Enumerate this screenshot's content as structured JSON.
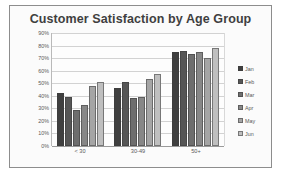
{
  "chart_data": {
    "type": "bar",
    "title": "Customer Satisfaction by Age Group",
    "xlabel": "",
    "ylabel": "",
    "categories": [
      "< 30",
      "30-49",
      "50+"
    ],
    "series": [
      {
        "name": "Jan",
        "color": "#3f3f3f",
        "values": [
          42,
          46,
          75
        ]
      },
      {
        "name": "Feb",
        "color": "#565656",
        "values": [
          39,
          51,
          76
        ]
      },
      {
        "name": "Mar",
        "color": "#6e6e6e",
        "values": [
          29,
          38,
          73
        ]
      },
      {
        "name": "Apr",
        "color": "#878787",
        "values": [
          33,
          39,
          75
        ]
      },
      {
        "name": "May",
        "color": "#a5a5a5",
        "values": [
          48,
          53,
          70
        ]
      },
      {
        "name": "Jun",
        "color": "#bfbfbf",
        "values": [
          51,
          57,
          78
        ]
      }
    ],
    "ylim": [
      0,
      90
    ],
    "ytick_step": 10,
    "ytick_labels": [
      "90%",
      "80%",
      "70%",
      "60%",
      "50%",
      "40%",
      "30%",
      "20%",
      "10%",
      "0%"
    ],
    "grid": true,
    "legend_position": "right",
    "value_suffix": "%"
  },
  "style": {
    "frame_border": "#8d8d8d",
    "plot_background": "#fdfdfd",
    "gridline_color": "#d2d2d2",
    "axis_color": "#9a9a9a",
    "title_color": "#3f3f3f",
    "tick_color": "#595959"
  }
}
